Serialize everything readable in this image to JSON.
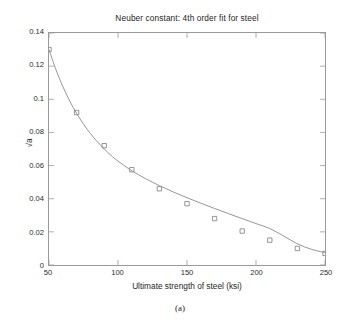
{
  "figure": {
    "caption": "(a)",
    "background": "#ffffff"
  },
  "chart_data": {
    "type": "line",
    "title": "Neuber constant: 4th order fit for steel",
    "xlabel": "Ultimate strength of steel (ksi)",
    "ylabel": "√a",
    "xlim": [
      50,
      250
    ],
    "ylim": [
      0,
      0.14
    ],
    "xticks": [
      50,
      100,
      150,
      200,
      250
    ],
    "xtick_labels": [
      "50",
      "100",
      "150",
      "200",
      "250"
    ],
    "yticks": [
      0,
      0.02,
      0.04,
      0.06,
      0.08,
      0.1,
      0.12,
      0.14
    ],
    "ytick_labels": [
      "0",
      "0.02",
      "0.04",
      "0.06",
      "0.08",
      "0.1",
      "0.12",
      "0.14"
    ],
    "grid": false,
    "legend": null,
    "series": [
      {
        "name": "data points",
        "marker": "square-open",
        "marker_color": "#8a8a8a",
        "linestyle": "none",
        "x": [
          50,
          70,
          90,
          110,
          130,
          150,
          170,
          190,
          210,
          230,
          250
        ],
        "values": [
          0.13,
          0.092,
          0.072,
          0.0575,
          0.046,
          0.037,
          0.028,
          0.0205,
          0.015,
          0.01,
          0.007
        ]
      },
      {
        "name": "4th order fit",
        "marker": "none",
        "line_color": "#8a8a8a",
        "linestyle": "solid",
        "x": [
          50,
          55,
          60,
          65,
          70,
          75,
          80,
          85,
          90,
          95,
          100,
          110,
          120,
          130,
          140,
          150,
          160,
          170,
          180,
          190,
          200,
          210,
          220,
          230,
          240,
          250
        ],
        "values": [
          0.13,
          0.118,
          0.1078,
          0.099,
          0.0915,
          0.085,
          0.0793,
          0.0744,
          0.07,
          0.0661,
          0.0627,
          0.0569,
          0.0521,
          0.0479,
          0.0441,
          0.0406,
          0.0373,
          0.0341,
          0.031,
          0.028,
          0.025,
          0.022,
          0.0175,
          0.0128,
          0.0095,
          0.0075
        ]
      }
    ]
  },
  "axes": {
    "line_color": "#9a9a9a",
    "tick_color": "#9a9a9a"
  }
}
